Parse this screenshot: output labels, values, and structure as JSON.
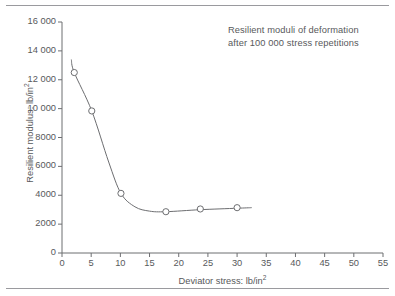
{
  "figure": {
    "annotation_line1": "Resilient moduli of deformation",
    "annotation_line2": "after 100 000 stress repetitions",
    "ylabel_text": "Resilient modulus: lb/in",
    "ylabel_exponent": "2",
    "xlabel_text": "Deviator stress: lb/in",
    "xlabel_exponent": "2",
    "axis_color": "#6d6e71",
    "curve_color": "#6d6e71",
    "marker_color": "#6d6e71",
    "text_color": "#58595b",
    "rule_color": "#9a9a9e"
  },
  "chart_data": {
    "type": "line",
    "title": "Resilient moduli of deformation after 100 000 stress repetitions",
    "xlabel": "Deviator stress: lb/in2",
    "ylabel": "Resilient modulus: lb/in2",
    "xlim": [
      0,
      55
    ],
    "ylim": [
      0,
      16000
    ],
    "grid": false,
    "legend": null,
    "xticks": [
      0,
      5,
      10,
      15,
      20,
      25,
      30,
      35,
      40,
      45,
      50,
      55
    ],
    "xtick_labels": [
      "0",
      "5",
      "10",
      "15",
      "20",
      "25",
      "30",
      "35",
      "40",
      "45",
      "50",
      "55"
    ],
    "yticks": [
      0,
      2000,
      4000,
      6000,
      8000,
      10000,
      12000,
      14000,
      16000
    ],
    "ytick_labels": [
      "0",
      "2000",
      "4000",
      "6000",
      "8000",
      "10 000",
      "12 000",
      "14 000",
      "16 000"
    ],
    "series": [
      {
        "name": "Resilient modulus vs deviator stress",
        "marker": "open-circle",
        "x": [
          2.1,
          5.1,
          10.1,
          17.8,
          23.7,
          30.0
        ],
        "y": [
          12500,
          9840,
          4130,
          2860,
          3050,
          3140
        ]
      }
    ],
    "curve_path_points": [
      {
        "x": 1.6,
        "y": 13400
      },
      {
        "x": 2.1,
        "y": 12500
      },
      {
        "x": 5.1,
        "y": 9840
      },
      {
        "x": 8.0,
        "y": 6300
      },
      {
        "x": 10.1,
        "y": 4130
      },
      {
        "x": 12.5,
        "y": 3200
      },
      {
        "x": 15.0,
        "y": 2900
      },
      {
        "x": 17.8,
        "y": 2860
      },
      {
        "x": 23.7,
        "y": 3000
      },
      {
        "x": 30.0,
        "y": 3100
      },
      {
        "x": 32.5,
        "y": 3140
      }
    ]
  }
}
